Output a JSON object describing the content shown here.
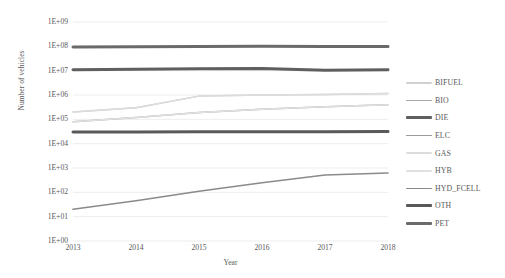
{
  "chart_data": {
    "type": "line",
    "title": "",
    "xlabel": "Year",
    "ylabel": "Number of vehicles",
    "yscale": "log",
    "ylim": [
      1,
      1000000000
    ],
    "grid": true,
    "legend_position": "right",
    "x": [
      2013,
      2014,
      2015,
      2016,
      2017,
      2018
    ],
    "categories": [
      "2013",
      "2014",
      "2015",
      "2016",
      "2017",
      "2018"
    ],
    "ytick_labels": [
      "1E+09",
      "1E+08",
      "1E+07",
      "1E+06",
      "1E+05",
      "1E+04",
      "1E+03",
      "1E+02",
      "1E+01",
      "1E+00"
    ],
    "ytick_values": [
      1000000000,
      100000000,
      10000000,
      1000000,
      100000,
      10000,
      1000,
      100,
      10,
      1
    ],
    "series": [
      {
        "name": "BIFUEL",
        "color": "#d0d0d0",
        "width": 1.5,
        "values": [
          200000,
          300000,
          900000,
          1000000,
          1050000,
          1150000
        ]
      },
      {
        "name": "BIO",
        "color": "#a8a8a8",
        "width": 1.5,
        "values": [
          80000,
          120000,
          190000,
          260000,
          330000,
          400000
        ]
      },
      {
        "name": "DIE",
        "color": "#5f5f5f",
        "width": 3.0,
        "values": [
          11000000,
          11500000,
          12000000,
          12300000,
          10500000,
          11000000
        ]
      },
      {
        "name": "ELC",
        "color": "#9a9a9a",
        "width": 1.5,
        "values": [
          30000,
          30500,
          31000,
          31000,
          31000,
          31500
        ]
      },
      {
        "name": "GAS",
        "color": "#dcdcdc",
        "width": 1.5,
        "values": [
          200000,
          300000,
          900000,
          1000000,
          1050000,
          1150000
        ]
      },
      {
        "name": "HYB",
        "color": "#e0e0e0",
        "width": 1.5,
        "values": [
          80000,
          120000,
          190000,
          260000,
          330000,
          400000
        ]
      },
      {
        "name": "HYD_FCELL",
        "color": "#8a8a8a",
        "width": 1.5,
        "values": [
          20,
          45,
          110,
          250,
          520,
          620
        ]
      },
      {
        "name": "OTH",
        "color": "#595959",
        "width": 3.0,
        "values": [
          30000,
          30500,
          31000,
          31000,
          31000,
          31500
        ]
      },
      {
        "name": "PET",
        "color": "#6a6a6a",
        "width": 3.0,
        "values": [
          95000000,
          97000000,
          99000000,
          100000000,
          98000000,
          99000000
        ]
      }
    ]
  },
  "legend": {
    "items": [
      {
        "label": "BIFUEL"
      },
      {
        "label": "BIO"
      },
      {
        "label": "DIE"
      },
      {
        "label": "ELC"
      },
      {
        "label": "GAS"
      },
      {
        "label": "HYB"
      },
      {
        "label": "HYD_FCELL"
      },
      {
        "label": "OTH"
      },
      {
        "label": "PET"
      }
    ]
  },
  "style": {
    "grid_color": "#e8e8e8",
    "text_color": "#595959",
    "background": "#ffffff"
  }
}
